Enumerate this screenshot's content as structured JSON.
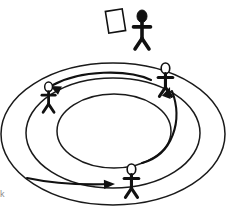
{
  "image": {
    "title": "Circular queue of stick figures with rotating arrows",
    "width": 227,
    "height": 213,
    "background_color": "#ffffff",
    "ink_color": "#111111",
    "stroke_color": "#1a1a1a"
  },
  "rings": {
    "label": "Concentric ellipse tracks",
    "count": 3,
    "color": "#1a1a1a",
    "items": [
      {
        "name": "outer-ring",
        "cx": 113,
        "cy": 134,
        "rx": 112,
        "ry": 71,
        "stroke_width": 1.5
      },
      {
        "name": "middle-ring",
        "cx": 113,
        "cy": 133,
        "rx": 87,
        "ry": 55,
        "stroke_width": 1.5
      },
      {
        "name": "inner-ring",
        "cx": 114,
        "cy": 131,
        "rx": 57,
        "ry": 37,
        "stroke_width": 1.5
      }
    ]
  },
  "figures": {
    "label": "Stick figures",
    "count": 4,
    "items": [
      {
        "name": "presenter-figure",
        "position": "top-outside",
        "head_fill": "filled",
        "head_color": "#111111",
        "x": 131,
        "y": 10,
        "scale": 1.0,
        "holds_object": true,
        "object": "white-card"
      },
      {
        "name": "left-figure",
        "position": "upper-left-ring",
        "head_fill": "outline",
        "head_color": "#ffffff",
        "x": 40,
        "y": 82,
        "scale": 0.78,
        "holds_object": false,
        "object": null
      },
      {
        "name": "right-figure",
        "position": "upper-right-ring",
        "head_fill": "outline",
        "head_color": "#ffffff",
        "x": 156,
        "y": 63,
        "scale": 0.86,
        "holds_object": false,
        "object": null
      },
      {
        "name": "bottom-figure",
        "position": "bottom-ring",
        "head_fill": "outline",
        "head_color": "#ffffff",
        "x": 122,
        "y": 164,
        "scale": 0.86,
        "holds_object": false,
        "object": null
      }
    ]
  },
  "held_object": {
    "name": "white-card",
    "shape": "rectangle",
    "fill": "#ffffff",
    "stroke": "#111111",
    "rotation_deg": -9,
    "x": 107,
    "y": 10,
    "width": 17,
    "height": 22
  },
  "arrows": {
    "label": "Curved direction arrows",
    "count": 3,
    "color": "#111111",
    "direction": "counter-clockwise circulation",
    "items": [
      {
        "name": "arrow-right-to-left",
        "from": "right-figure",
        "to": "left-figure",
        "points_toward": "left",
        "path": "M151,80 C128,69 80,70 53,85",
        "head_x": 50,
        "head_y": 86,
        "head_angle_deg": 205
      },
      {
        "name": "arrow-bottom-to-right",
        "from": "bottom-figure",
        "to": "right-figure",
        "points_toward": "upper-left",
        "path": "M142,163 C173,155 183,120 172,91",
        "head_x": 170,
        "head_y": 87,
        "head_angle_deg": 290
      },
      {
        "name": "arrow-left-to-bottom",
        "from": "left-figure",
        "to": "bottom-figure",
        "points_toward": "right",
        "path": "M27,178 C55,184 85,185 111,184",
        "head_x": 115,
        "head_y": 184,
        "head_angle_deg": 358
      }
    ]
  },
  "corner_mark": {
    "name": "cropped-edge-mark",
    "text": "k",
    "visible": true
  }
}
